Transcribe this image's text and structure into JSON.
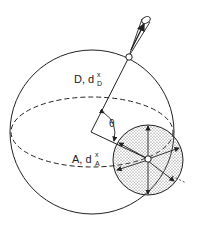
{
  "figure": {
    "labels": {
      "d_label": "D, d",
      "d_sup": "x",
      "d_sub": "D",
      "a_label": "A, d",
      "a_sup": "x",
      "a_sub": "A",
      "theta": "θ"
    },
    "colors": {
      "stroke": "#222222",
      "background": "#ffffff",
      "stipple": "#555555"
    },
    "elements": {
      "large_sphere": "donor sphere D",
      "small_sphere": "acceptor sphere A (stippled)",
      "equator": "dashed equatorial ellipse",
      "probe": "light cone / emission probe at top",
      "angle": "theta"
    }
  }
}
